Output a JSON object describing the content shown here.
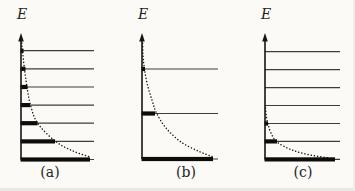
{
  "figure": {
    "background": "#fbfaf7",
    "axis_color": "#161616",
    "level_color": "#3d3d3d",
    "bar_color": "#0c0c0c",
    "curve_color": "#1a1a1a",
    "text_color": "#1f1f1f",
    "panels": [
      {
        "id": "a",
        "axis_label": "E",
        "caption": "(a)",
        "x0": 21,
        "axis_top": 33,
        "axis_bottom": 159.5,
        "level_right": 94,
        "caption_x": 50,
        "caption_y": 164,
        "label_y": 6,
        "levels": [
          {
            "y": 50.7,
            "bar": 2.5
          },
          {
            "y": 68.8,
            "bar": 4.5
          },
          {
            "y": 87.0,
            "bar": 6.5
          },
          {
            "y": 105.1,
            "bar": 9.0
          },
          {
            "y": 123.2,
            "bar": 16.5
          },
          {
            "y": 141.4,
            "bar": 34.0
          },
          {
            "y": 159.5,
            "bar": 69.0
          }
        ],
        "curve": [
          [
            21.5,
            40
          ],
          [
            22.5,
            51
          ],
          [
            24.5,
            69
          ],
          [
            27,
            87
          ],
          [
            30.5,
            105
          ],
          [
            37.5,
            123
          ],
          [
            55,
            141
          ],
          [
            73,
            151
          ],
          [
            90,
            157
          ]
        ]
      },
      {
        "id": "b",
        "axis_label": "E",
        "caption": "(b)",
        "x0": 142,
        "axis_top": 33,
        "axis_bottom": 159.0,
        "level_right": 218,
        "caption_x": 186,
        "caption_y": 164,
        "label_y": 6,
        "levels": [
          {
            "y": 69.0,
            "bar": 3.0
          },
          {
            "y": 113.5,
            "bar": 13.0
          },
          {
            "y": 159.0,
            "bar": 71.0
          }
        ],
        "curve": [
          [
            142.5,
            37
          ],
          [
            143,
            55
          ],
          [
            144.5,
            69
          ],
          [
            147.5,
            85
          ],
          [
            152,
            100
          ],
          [
            156.5,
            113
          ],
          [
            166,
            128
          ],
          [
            181,
            142
          ],
          [
            198,
            151
          ],
          [
            212,
            156.5
          ]
        ]
      },
      {
        "id": "c",
        "axis_label": "E",
        "caption": "(c)",
        "x0": 265,
        "axis_top": 33,
        "axis_bottom": 159.4,
        "level_right": 340,
        "caption_x": 303,
        "caption_y": 164,
        "label_y": 6,
        "levels": [
          {
            "y": 51.7,
            "bar": 0
          },
          {
            "y": 69.6,
            "bar": 0
          },
          {
            "y": 87.6,
            "bar": 0
          },
          {
            "y": 105.5,
            "bar": 0
          },
          {
            "y": 123.5,
            "bar": 3.0
          },
          {
            "y": 141.4,
            "bar": 12.0
          },
          {
            "y": 159.4,
            "bar": 70.0
          }
        ],
        "curve": [
          [
            265.5,
            108
          ],
          [
            266.5,
            117
          ],
          [
            268,
            124
          ],
          [
            271,
            133
          ],
          [
            277,
            142
          ],
          [
            292,
            150
          ],
          [
            310,
            155
          ],
          [
            330,
            158
          ]
        ]
      }
    ]
  }
}
